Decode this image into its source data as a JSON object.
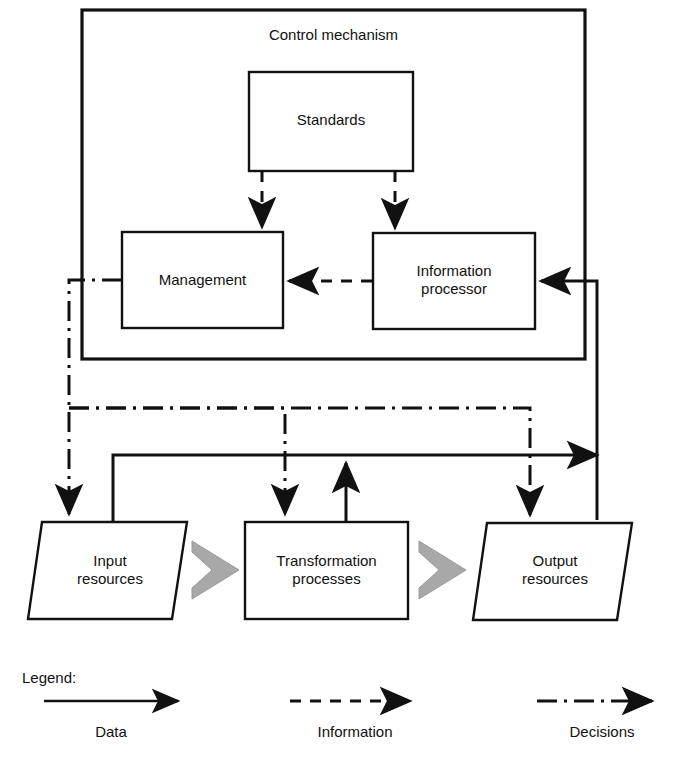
{
  "diagram": {
    "title": "Control mechanism",
    "container": {
      "name": "control-mechanism-boundary",
      "label": "Control mechanism"
    },
    "nodes": [
      {
        "id": "standards",
        "label": "Standards",
        "shape": "rectangle"
      },
      {
        "id": "management",
        "label": "Management",
        "shape": "rectangle"
      },
      {
        "id": "information-processor",
        "label": "Information\nprocessor",
        "shape": "rectangle"
      },
      {
        "id": "input-resources",
        "label": "Input\nresources",
        "shape": "parallelogram"
      },
      {
        "id": "transformation-processes",
        "label": "Transformation\nprocesses",
        "shape": "rectangle"
      },
      {
        "id": "output-resources",
        "label": "Output\nresources",
        "shape": "parallelogram"
      }
    ],
    "flow_arrows": [
      {
        "from": "input-resources",
        "to": "transformation-processes",
        "style": "block-chevron"
      },
      {
        "from": "transformation-processes",
        "to": "output-resources",
        "style": "block-chevron"
      }
    ],
    "connections": [
      {
        "from": "standards",
        "to": "management",
        "type": "information"
      },
      {
        "from": "standards",
        "to": "information-processor",
        "type": "information"
      },
      {
        "from": "information-processor",
        "to": "management",
        "type": "information"
      },
      {
        "from": "management",
        "to": "input-resources",
        "type": "decisions"
      },
      {
        "from": "management",
        "to": "transformation-processes",
        "type": "decisions"
      },
      {
        "from": "management",
        "to": "output-resources",
        "type": "decisions"
      },
      {
        "from": "input-resources",
        "to": "information-processor",
        "type": "data"
      },
      {
        "from": "transformation-processes",
        "to": "information-processor",
        "type": "data"
      },
      {
        "from": "output-resources",
        "to": "information-processor",
        "type": "data"
      }
    ]
  },
  "legend": {
    "heading": "Legend:",
    "items": [
      {
        "label": "Data",
        "line_style": "solid"
      },
      {
        "label": "Information",
        "line_style": "dashed"
      },
      {
        "label": "Decisions",
        "line_style": "dash-dot"
      }
    ]
  },
  "colors": {
    "stroke": "#111111",
    "background": "#ffffff",
    "flow_arrow_fill": "#a8a8a8",
    "flow_arrow_stroke": "#8f8f8f"
  }
}
